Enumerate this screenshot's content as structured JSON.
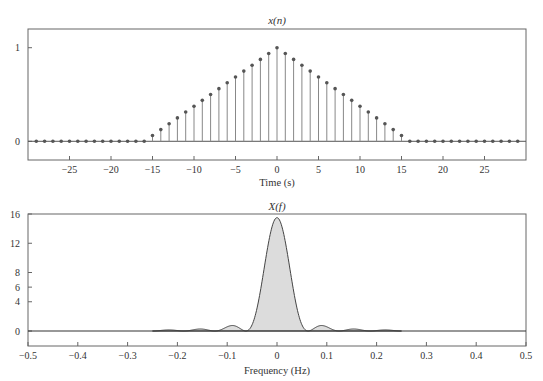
{
  "chart_data": [
    {
      "type": "stem",
      "title": "x(n)",
      "xlabel": "Time (s)",
      "ylabel": "",
      "xlim": [
        -30,
        30
      ],
      "ylim": [
        -0.2,
        1.2
      ],
      "xticks": [
        -25,
        -20,
        -15,
        -10,
        -5,
        0,
        5,
        10,
        15,
        20,
        25
      ],
      "xtick_labels": [
        "−25",
        "−20",
        "−15",
        "−10",
        "−5",
        "0",
        "5",
        "10",
        "15",
        "20",
        "25"
      ],
      "yticks": [
        0,
        1
      ],
      "ytick_labels": [
        "0",
        "1"
      ],
      "grid": false,
      "x": [
        -29,
        -28,
        -27,
        -26,
        -25,
        -24,
        -23,
        -22,
        -21,
        -20,
        -19,
        -18,
        -17,
        -16,
        -15,
        -14,
        -13,
        -12,
        -11,
        -10,
        -9,
        -8,
        -7,
        -6,
        -5,
        -4,
        -3,
        -2,
        -1,
        0,
        1,
        2,
        3,
        4,
        5,
        6,
        7,
        8,
        9,
        10,
        11,
        12,
        13,
        14,
        15,
        16,
        17,
        18,
        19,
        20,
        21,
        22,
        23,
        24,
        25,
        26,
        27,
        28,
        29
      ],
      "values": [
        0,
        0,
        0,
        0,
        0,
        0,
        0,
        0,
        0,
        0,
        0,
        0,
        0,
        0,
        0.0625,
        0.125,
        0.1875,
        0.25,
        0.3125,
        0.375,
        0.4375,
        0.5,
        0.5625,
        0.625,
        0.6875,
        0.75,
        0.8125,
        0.875,
        0.9375,
        1,
        0.9375,
        0.875,
        0.8125,
        0.75,
        0.6875,
        0.625,
        0.5625,
        0.5,
        0.4375,
        0.375,
        0.3125,
        0.25,
        0.1875,
        0.125,
        0.0625,
        0,
        0,
        0,
        0,
        0,
        0,
        0,
        0,
        0,
        0,
        0,
        0,
        0,
        0
      ]
    },
    {
      "type": "area",
      "title": "X(f)",
      "xlabel": "Frequency (Hz)",
      "ylabel": "",
      "xlim": [
        -0.5,
        0.5
      ],
      "ylim": [
        -1.5,
        16
      ],
      "xticks": [
        -0.5,
        -0.4,
        -0.3,
        -0.2,
        -0.1,
        0,
        0.1,
        0.2,
        0.3,
        0.4,
        0.5
      ],
      "xtick_labels": [
        "−0.5",
        "−0.4",
        "−0.3",
        "−0.2",
        "−0.1",
        "0",
        "0.1",
        "0.2",
        "0.3",
        "0.4",
        "0.5"
      ],
      "yticks": [
        0,
        4,
        6,
        8,
        12,
        16
      ],
      "ytick_labels": [
        "0",
        "4",
        "6",
        "8",
        "12",
        "16"
      ],
      "grid": false,
      "peak": {
        "f": 0,
        "value": 15.5
      },
      "mainlobe_zeros": [
        -0.0625,
        0.0625
      ],
      "sidelobes": [
        {
          "f": -0.16,
          "value": 0.4
        },
        {
          "f": -0.09,
          "value": 0.9
        },
        {
          "f": 0.09,
          "value": 0.9
        },
        {
          "f": 0.16,
          "value": 0.4
        }
      ],
      "plotted_range": [
        -0.25,
        0.25
      ],
      "fill_color": "#dcdcdc",
      "line_color": "#444444"
    }
  ]
}
